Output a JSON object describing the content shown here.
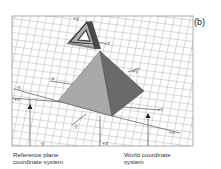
{
  "figure": {
    "panel_label": "(b)",
    "axis_labels": {
      "plus_y_top": "+y",
      "plus_z_object": "+z",
      "minus_x_ref": "-x",
      "minus_x_left": "-x",
      "plus_y_right": "+y",
      "plus_x_world": "+x",
      "plus_x_ref": "+x",
      "minus_y_world": "-y",
      "minus_y_ref": "-y",
      "plus_z_world": "+z",
      "plus_z_left": "+z"
    },
    "captions": {
      "reference": [
        "Reference plane",
        "coordinate system"
      ],
      "world": [
        "World coordinate",
        "system"
      ]
    },
    "colors": {
      "grid": "#b8b8b8",
      "frame": "#999999",
      "pyramid_left": "#a9a9a9",
      "pyramid_right": "#6a6a6a",
      "object_dark": "#4a4a4a",
      "object_light": "#b0b0b0"
    }
  }
}
